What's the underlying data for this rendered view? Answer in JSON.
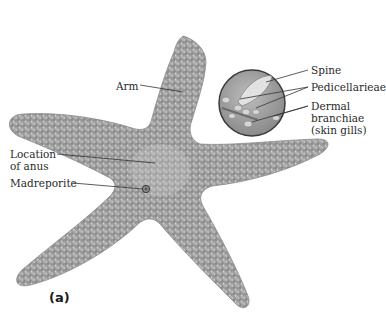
{
  "figure": {
    "panel_label": "(a)",
    "labels": {
      "arm": "Arm",
      "location_of_anus_line1": "Location",
      "location_of_anus_line2": "of anus",
      "madreporite": "Madreporite",
      "spine": "Spine",
      "pedicellarieae": "Pedicellarieae",
      "dermal_line1": "Dermal",
      "dermal_line2": "branchiae",
      "dermal_line3": "(skin gills)"
    },
    "colors": {
      "body": "#9a9a9a",
      "body_light": "#c4c4c4",
      "body_dark": "#6e6e6e",
      "leader_line": "#333333",
      "text": "#2a2a2a",
      "background": "#ffffff"
    }
  }
}
